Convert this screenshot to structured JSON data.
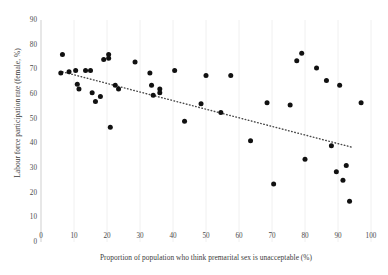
{
  "chart_data": {
    "type": "scatter",
    "title": "",
    "xlabel": "Proportion of population who think premarital sex is unacceptable (%)",
    "ylabel": "Labour force participation rate (female, %)",
    "xlim": [
      0,
      100
    ],
    "ylim": [
      0,
      90
    ],
    "xticks": [
      0,
      10,
      20,
      30,
      40,
      50,
      60,
      70,
      80,
      90,
      100
    ],
    "yticks": [
      0,
      10,
      20,
      30,
      40,
      50,
      60,
      70,
      80,
      90
    ],
    "grid": "vertical-light",
    "legend": "none",
    "marker": {
      "shape": "circle",
      "color": "#111111",
      "size_px": 5
    },
    "points": [
      {
        "x": 6.5,
        "y": 76.0
      },
      {
        "x": 6.0,
        "y": 68.5
      },
      {
        "x": 8.5,
        "y": 69.0
      },
      {
        "x": 10.5,
        "y": 69.5
      },
      {
        "x": 11.0,
        "y": 64.0
      },
      {
        "x": 11.5,
        "y": 62.0
      },
      {
        "x": 13.5,
        "y": 69.5
      },
      {
        "x": 15.0,
        "y": 69.5
      },
      {
        "x": 15.5,
        "y": 60.5
      },
      {
        "x": 16.5,
        "y": 57.0
      },
      {
        "x": 18.0,
        "y": 59.0
      },
      {
        "x": 19.0,
        "y": 74.0
      },
      {
        "x": 20.5,
        "y": 76.0
      },
      {
        "x": 20.5,
        "y": 74.5
      },
      {
        "x": 21.0,
        "y": 46.5
      },
      {
        "x": 22.5,
        "y": 63.5
      },
      {
        "x": 23.5,
        "y": 62.0
      },
      {
        "x": 28.5,
        "y": 73.0
      },
      {
        "x": 33.0,
        "y": 68.5
      },
      {
        "x": 33.5,
        "y": 63.5
      },
      {
        "x": 34.0,
        "y": 59.5
      },
      {
        "x": 36.0,
        "y": 62.0
      },
      {
        "x": 36.0,
        "y": 60.5
      },
      {
        "x": 40.5,
        "y": 69.5
      },
      {
        "x": 43.5,
        "y": 49.0
      },
      {
        "x": 48.5,
        "y": 56.0
      },
      {
        "x": 50.0,
        "y": 67.5
      },
      {
        "x": 54.5,
        "y": 52.5
      },
      {
        "x": 57.5,
        "y": 67.5
      },
      {
        "x": 63.5,
        "y": 41.0
      },
      {
        "x": 68.5,
        "y": 56.5
      },
      {
        "x": 70.5,
        "y": 23.5
      },
      {
        "x": 75.5,
        "y": 55.5
      },
      {
        "x": 77.5,
        "y": 73.5
      },
      {
        "x": 79.0,
        "y": 76.5
      },
      {
        "x": 80.0,
        "y": 33.5
      },
      {
        "x": 83.5,
        "y": 70.5
      },
      {
        "x": 86.5,
        "y": 65.5
      },
      {
        "x": 88.0,
        "y": 39.0
      },
      {
        "x": 89.5,
        "y": 28.5
      },
      {
        "x": 90.5,
        "y": 63.5
      },
      {
        "x": 91.5,
        "y": 25.0
      },
      {
        "x": 92.5,
        "y": 31.0
      },
      {
        "x": 93.5,
        "y": 16.5
      },
      {
        "x": 97.0,
        "y": 56.5
      }
    ],
    "trendline": {
      "style": "dotted",
      "color": "#4a4a4a",
      "x_start": 6.5,
      "y_start": 69.0,
      "x_end": 94.0,
      "y_end": 38.5
    }
  }
}
